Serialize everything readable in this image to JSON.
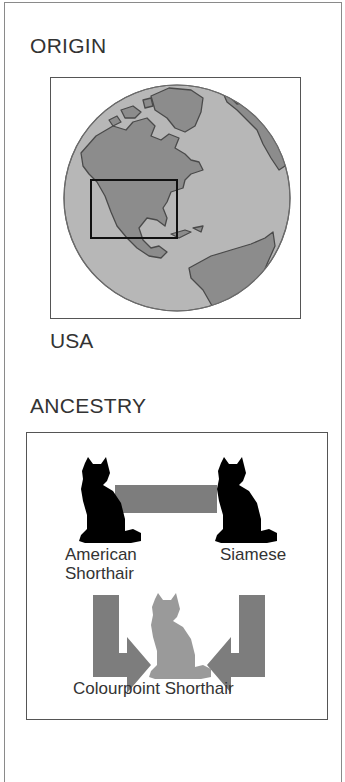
{
  "origin": {
    "heading": "ORIGIN",
    "map": {
      "icon": "globe-map-icon",
      "highlight_region": "USA",
      "colors": {
        "ocean": "#b7b7b7",
        "land": "#8c8c8c",
        "coastline": "#4a4a4a",
        "highlight_box": "#111111"
      }
    },
    "value": "USA"
  },
  "ancestry": {
    "heading": "ANCESTRY",
    "parents": [
      {
        "name": "American\nShorthair",
        "icon": "cat-silhouette-icon",
        "color": "#000000"
      },
      {
        "name": "Siamese",
        "icon": "cat-silhouette-icon",
        "color": "#000000"
      }
    ],
    "offspring": {
      "name": "Colourpoint Shorthair",
      "icon": "cat-silhouette-icon",
      "color": "#9a9a9a"
    },
    "colors": {
      "connector": "#7d7d7d",
      "arrow": "#7d7d7d"
    }
  }
}
